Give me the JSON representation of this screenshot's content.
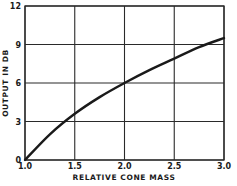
{
  "chart_data": {
    "type": "line",
    "title": "",
    "xlabel": "RELATIVE CONE MASS",
    "ylabel": "OUTPUT IN DB",
    "xlim": [
      1.0,
      3.0
    ],
    "ylim": [
      0,
      12
    ],
    "grid": true,
    "legend": null,
    "x_ticks": [
      "1.0",
      "1.5",
      "2.0",
      "2.5",
      "3.0"
    ],
    "y_ticks": [
      "0",
      "3",
      "6",
      "9",
      "12"
    ],
    "series": [
      {
        "name": "Output vs relative cone mass",
        "x": [
          1.0,
          1.25,
          1.5,
          1.75,
          2.0,
          2.25,
          2.5,
          2.75,
          3.0
        ],
        "y": [
          0,
          2.0,
          3.6,
          4.9,
          6.0,
          7.0,
          7.9,
          8.8,
          9.5
        ]
      }
    ]
  },
  "colors": {
    "line": "#1a1a1a",
    "grid": "#2a2a2a",
    "background": "#ffffff"
  }
}
